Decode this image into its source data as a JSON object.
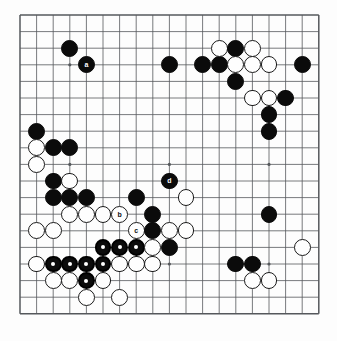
{
  "board": {
    "name": "go-board-diagram",
    "size": 19,
    "origin_x": 20,
    "origin_y": 15,
    "spacing": 16.6,
    "line_color": "#55585c",
    "border_color": "#55585c",
    "background_color": "#fdfdfd",
    "black_color": "#0b0b0b",
    "white_color": "#fefefe",
    "white_edge_color": "#1a1a1a",
    "marker_color": "#ffffff",
    "star_points": [
      [
        3,
        3
      ],
      [
        9,
        3
      ],
      [
        15,
        3
      ],
      [
        3,
        9
      ],
      [
        9,
        9
      ],
      [
        15,
        9
      ],
      [
        3,
        15
      ],
      [
        9,
        15
      ],
      [
        15,
        15
      ]
    ]
  },
  "stones": [
    {
      "c": 3,
      "r": 2,
      "color": "black",
      "mark": "none",
      "label": ""
    },
    {
      "c": 4,
      "r": 3,
      "color": "black",
      "mark": "label",
      "label": "a"
    },
    {
      "c": 9,
      "r": 3,
      "color": "black",
      "mark": "none",
      "label": ""
    },
    {
      "c": 11,
      "r": 3,
      "color": "black",
      "mark": "none",
      "label": ""
    },
    {
      "c": 12,
      "r": 3,
      "color": "black",
      "mark": "none",
      "label": ""
    },
    {
      "c": 17,
      "r": 3,
      "color": "black",
      "mark": "none",
      "label": ""
    },
    {
      "c": 12,
      "r": 2,
      "color": "white",
      "mark": "none",
      "label": ""
    },
    {
      "c": 13,
      "r": 2,
      "color": "black",
      "mark": "none",
      "label": ""
    },
    {
      "c": 14,
      "r": 2,
      "color": "white",
      "mark": "none",
      "label": ""
    },
    {
      "c": 13,
      "r": 3,
      "color": "white",
      "mark": "none",
      "label": ""
    },
    {
      "c": 14,
      "r": 3,
      "color": "white",
      "mark": "none",
      "label": ""
    },
    {
      "c": 15,
      "r": 3,
      "color": "white",
      "mark": "none",
      "label": ""
    },
    {
      "c": 13,
      "r": 4,
      "color": "black",
      "mark": "none",
      "label": ""
    },
    {
      "c": 14,
      "r": 5,
      "color": "white",
      "mark": "none",
      "label": ""
    },
    {
      "c": 15,
      "r": 5,
      "color": "white",
      "mark": "none",
      "label": ""
    },
    {
      "c": 16,
      "r": 5,
      "color": "black",
      "mark": "none",
      "label": ""
    },
    {
      "c": 15,
      "r": 6,
      "color": "black",
      "mark": "none",
      "label": ""
    },
    {
      "c": 15,
      "r": 7,
      "color": "black",
      "mark": "none",
      "label": ""
    },
    {
      "c": 1,
      "r": 7,
      "color": "black",
      "mark": "none",
      "label": ""
    },
    {
      "c": 1,
      "r": 8,
      "color": "white",
      "mark": "none",
      "label": ""
    },
    {
      "c": 2,
      "r": 8,
      "color": "black",
      "mark": "none",
      "label": ""
    },
    {
      "c": 3,
      "r": 8,
      "color": "black",
      "mark": "none",
      "label": ""
    },
    {
      "c": 1,
      "r": 9,
      "color": "white",
      "mark": "none",
      "label": ""
    },
    {
      "c": 2,
      "r": 10,
      "color": "black",
      "mark": "none",
      "label": ""
    },
    {
      "c": 3,
      "r": 10,
      "color": "white",
      "mark": "none",
      "label": ""
    },
    {
      "c": 2,
      "r": 11,
      "color": "black",
      "mark": "none",
      "label": ""
    },
    {
      "c": 3,
      "r": 11,
      "color": "black",
      "mark": "none",
      "label": ""
    },
    {
      "c": 4,
      "r": 11,
      "color": "black",
      "mark": "none",
      "label": ""
    },
    {
      "c": 7,
      "r": 11,
      "color": "black",
      "mark": "none",
      "label": ""
    },
    {
      "c": 9,
      "r": 10,
      "color": "black",
      "mark": "label",
      "label": "d"
    },
    {
      "c": 10,
      "r": 11,
      "color": "white",
      "mark": "none",
      "label": ""
    },
    {
      "c": 3,
      "r": 12,
      "color": "white",
      "mark": "none",
      "label": ""
    },
    {
      "c": 4,
      "r": 12,
      "color": "white",
      "mark": "none",
      "label": ""
    },
    {
      "c": 5,
      "r": 12,
      "color": "white",
      "mark": "none",
      "label": ""
    },
    {
      "c": 6,
      "r": 12,
      "color": "white",
      "mark": "label",
      "label": "b"
    },
    {
      "c": 8,
      "r": 12,
      "color": "black",
      "mark": "none",
      "label": ""
    },
    {
      "c": 15,
      "r": 12,
      "color": "black",
      "mark": "none",
      "label": ""
    },
    {
      "c": 1,
      "r": 13,
      "color": "white",
      "mark": "none",
      "label": ""
    },
    {
      "c": 2,
      "r": 13,
      "color": "white",
      "mark": "none",
      "label": ""
    },
    {
      "c": 7,
      "r": 13,
      "color": "white",
      "mark": "label",
      "label": "c"
    },
    {
      "c": 8,
      "r": 13,
      "color": "black",
      "mark": "none",
      "label": ""
    },
    {
      "c": 9,
      "r": 13,
      "color": "white",
      "mark": "none",
      "label": ""
    },
    {
      "c": 10,
      "r": 13,
      "color": "white",
      "mark": "none",
      "label": ""
    },
    {
      "c": 5,
      "r": 14,
      "color": "black",
      "mark": "dot",
      "label": ""
    },
    {
      "c": 6,
      "r": 14,
      "color": "black",
      "mark": "dot",
      "label": ""
    },
    {
      "c": 7,
      "r": 14,
      "color": "black",
      "mark": "dot",
      "label": ""
    },
    {
      "c": 8,
      "r": 14,
      "color": "white",
      "mark": "none",
      "label": ""
    },
    {
      "c": 9,
      "r": 14,
      "color": "black",
      "mark": "none",
      "label": ""
    },
    {
      "c": 17,
      "r": 14,
      "color": "white",
      "mark": "none",
      "label": ""
    },
    {
      "c": 1,
      "r": 15,
      "color": "white",
      "mark": "none",
      "label": ""
    },
    {
      "c": 2,
      "r": 15,
      "color": "black",
      "mark": "dot",
      "label": ""
    },
    {
      "c": 3,
      "r": 15,
      "color": "black",
      "mark": "dot",
      "label": ""
    },
    {
      "c": 4,
      "r": 15,
      "color": "black",
      "mark": "dot",
      "label": ""
    },
    {
      "c": 5,
      "r": 15,
      "color": "black",
      "mark": "dot",
      "label": ""
    },
    {
      "c": 6,
      "r": 15,
      "color": "white",
      "mark": "none",
      "label": ""
    },
    {
      "c": 7,
      "r": 15,
      "color": "white",
      "mark": "none",
      "label": ""
    },
    {
      "c": 8,
      "r": 15,
      "color": "white",
      "mark": "none",
      "label": ""
    },
    {
      "c": 13,
      "r": 15,
      "color": "black",
      "mark": "none",
      "label": ""
    },
    {
      "c": 14,
      "r": 15,
      "color": "black",
      "mark": "none",
      "label": ""
    },
    {
      "c": 2,
      "r": 16,
      "color": "white",
      "mark": "none",
      "label": ""
    },
    {
      "c": 3,
      "r": 16,
      "color": "white",
      "mark": "none",
      "label": ""
    },
    {
      "c": 4,
      "r": 16,
      "color": "black",
      "mark": "dot",
      "label": ""
    },
    {
      "c": 5,
      "r": 16,
      "color": "white",
      "mark": "none",
      "label": ""
    },
    {
      "c": 14,
      "r": 16,
      "color": "white",
      "mark": "none",
      "label": ""
    },
    {
      "c": 15,
      "r": 16,
      "color": "white",
      "mark": "none",
      "label": ""
    },
    {
      "c": 4,
      "r": 17,
      "color": "white",
      "mark": "none",
      "label": ""
    },
    {
      "c": 6,
      "r": 17,
      "color": "white",
      "mark": "none",
      "label": ""
    }
  ]
}
